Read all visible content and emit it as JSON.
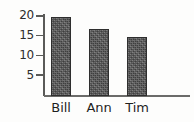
{
  "chart_data": {
    "type": "bar",
    "title": "",
    "xlabel": "",
    "ylabel": "",
    "categories": [
      "Bill",
      "Ann",
      "Tim"
    ],
    "values": [
      20,
      17,
      15
    ],
    "ylim": [
      0,
      21
    ],
    "yticks": [
      5,
      10,
      15,
      20
    ],
    "ytick_labels": [
      "5",
      "10",
      "15",
      "20"
    ],
    "grid": false,
    "legend": false,
    "legend_position": "none",
    "bar_color": "#5d5d5d",
    "bar_edge_color": "#2e2e2e",
    "axis_color": "#5a5a58",
    "background_color": "#fdfdfc"
  },
  "axis": {
    "ticks": [
      {
        "label": "20",
        "value": 20
      },
      {
        "label": "15",
        "value": 15
      },
      {
        "label": "10",
        "value": 10
      },
      {
        "label": "5",
        "value": 5
      }
    ]
  },
  "bars": [
    {
      "label": "Bill",
      "value": 20
    },
    {
      "label": "Ann",
      "value": 17
    },
    {
      "label": "Tim",
      "value": 15
    }
  ]
}
